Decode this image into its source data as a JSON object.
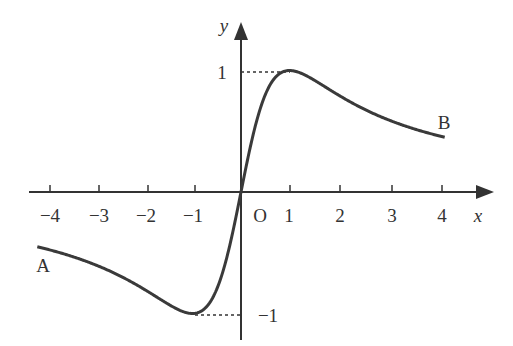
{
  "chart_data": {
    "type": "line",
    "title": "",
    "function_hint": "y = 2x/(1+x^2)",
    "xlabel": "x",
    "ylabel": "y",
    "origin_label": "O",
    "x_ticks": [
      -4,
      -3,
      -2,
      -1,
      1,
      2,
      3,
      4
    ],
    "x_tick_labels": [
      "−4",
      "−3",
      "−2",
      "−1",
      "1",
      "2",
      "3",
      "4"
    ],
    "y_ticks": [
      1,
      -1
    ],
    "y_tick_labels": [
      "1",
      "−1"
    ],
    "xlim": [
      -4.2,
      4.2
    ],
    "ylim": [
      -1,
      1
    ],
    "grid": false,
    "legend": "none",
    "annotations": [
      {
        "text": "A",
        "x": -4.2,
        "y": -0.45
      },
      {
        "text": "B",
        "x": 4.1,
        "y": 0.47
      },
      {
        "text": "max",
        "x": 1,
        "y": 1,
        "dashed_guide": true
      },
      {
        "text": "min",
        "x": -1,
        "y": -1,
        "dashed_guide": true
      }
    ],
    "series": [
      {
        "name": "curve",
        "x": [
          -4.2,
          -4,
          -3,
          -2,
          -1.5,
          -1,
          -0.5,
          0,
          0.5,
          1,
          1.5,
          2,
          3,
          4,
          4.2
        ],
        "y": [
          -0.45,
          -0.47,
          -0.6,
          -0.8,
          -0.92,
          -1,
          -0.8,
          0,
          0.8,
          1,
          0.92,
          0.8,
          0.6,
          0.47,
          0.45
        ]
      }
    ]
  },
  "labels": {
    "x_axis": "x",
    "y_axis": "y",
    "origin": "O",
    "point_a": "A",
    "point_b": "B",
    "y_one": "1",
    "y_minus_one": "−1",
    "xt": [
      "−4",
      "−3",
      "−2",
      "−1",
      "1",
      "2",
      "3",
      "4"
    ]
  }
}
